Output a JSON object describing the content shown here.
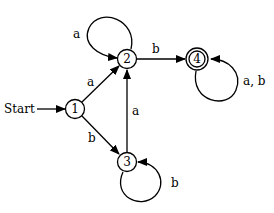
{
  "diagram": {
    "type": "finite-automaton",
    "start_label": "Start",
    "states": [
      {
        "id": "1",
        "label": "1",
        "accepting": false
      },
      {
        "id": "2",
        "label": "2",
        "accepting": false
      },
      {
        "id": "3",
        "label": "3",
        "accepting": false
      },
      {
        "id": "4",
        "label": "4",
        "accepting": true
      }
    ],
    "transitions": [
      {
        "from": "1",
        "to": "2",
        "label": "a"
      },
      {
        "from": "1",
        "to": "3",
        "label": "b"
      },
      {
        "from": "2",
        "to": "2",
        "label": "a"
      },
      {
        "from": "2",
        "to": "4",
        "label": "b"
      },
      {
        "from": "3",
        "to": "2",
        "label": "a"
      },
      {
        "from": "3",
        "to": "3",
        "label": "b"
      },
      {
        "from": "4",
        "to": "4",
        "label": "a, b"
      }
    ]
  }
}
